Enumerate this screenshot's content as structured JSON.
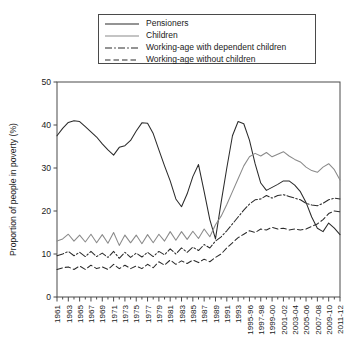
{
  "chart_data": {
    "type": "line",
    "title": "",
    "xlabel": "",
    "ylabel": "Proportion of people in poverty (%)",
    "ylim": [
      0,
      50
    ],
    "yticks": [
      0,
      10,
      20,
      30,
      40,
      50
    ],
    "grid": false,
    "legend_position": "top-center",
    "x": [
      "1961",
      "1962",
      "1963",
      "1964",
      "1965",
      "1966",
      "1967",
      "1968",
      "1969",
      "1970",
      "1971",
      "1972",
      "1973",
      "1974",
      "1975",
      "1976",
      "1977",
      "1978",
      "1979",
      "1980",
      "1981",
      "1982",
      "1983",
      "1984",
      "1985",
      "1986",
      "1987",
      "1988",
      "1989",
      "1990",
      "1991",
      "1992",
      "1993",
      "1994-95",
      "1995-96",
      "1996-97",
      "1997-98",
      "1998-99",
      "1999-00",
      "2000-01",
      "2001-02",
      "2002-03",
      "2003-04",
      "2004-05",
      "2005-06",
      "2006-07",
      "2007-08",
      "2008-09",
      "2009-10",
      "2010-11",
      "2011-12"
    ],
    "xtick_labels": [
      "1961",
      "1963",
      "1965",
      "1967",
      "1969",
      "1971",
      "1973",
      "1975",
      "1977",
      "1979",
      "1981",
      "1983",
      "1985",
      "1987",
      "1989",
      "1991",
      "1993",
      "1995-96",
      "1997-98",
      "1999-00",
      "2001-02",
      "2003-04",
      "2005-06",
      "2007-08",
      "2009-10",
      "2011-12"
    ],
    "series": [
      {
        "name": "Pensioners",
        "style": "solid",
        "color": "#2b2b2b",
        "values": [
          37.5,
          39.2,
          40.6,
          41.0,
          40.8,
          39.6,
          38.4,
          37.2,
          35.6,
          34.2,
          33.0,
          34.8,
          35.2,
          36.4,
          38.6,
          40.5,
          40.4,
          38.0,
          34.2,
          30.5,
          27.0,
          22.8,
          21.0,
          24.0,
          28.0,
          30.8,
          24.5,
          18.0,
          13.5,
          22.0,
          30.0,
          37.5,
          40.8,
          40.3,
          36.5,
          31.0,
          26.5,
          24.8,
          25.5,
          26.2,
          27.0,
          27.0,
          26.0,
          24.5,
          22.0,
          18.6,
          16.0,
          15.2,
          17.2,
          16.0,
          14.5
        ]
      },
      {
        "name": "Children",
        "style": "solid",
        "color": "#8a8a8a",
        "values": [
          13.0,
          13.5,
          14.6,
          13.0,
          14.4,
          12.8,
          14.6,
          12.6,
          14.5,
          12.5,
          15.0,
          12.0,
          14.4,
          12.6,
          14.4,
          12.4,
          14.5,
          12.6,
          14.6,
          13.0,
          15.2,
          13.2,
          15.2,
          13.4,
          15.3,
          13.6,
          15.8,
          14.0,
          16.8,
          18.8,
          21.5,
          24.5,
          27.5,
          30.5,
          32.6,
          33.4,
          32.8,
          33.6,
          32.6,
          33.2,
          33.8,
          32.8,
          32.0,
          31.4,
          30.2,
          29.4,
          29.0,
          30.2,
          31.0,
          29.6,
          27.2
        ]
      },
      {
        "name": "Working-age with dependent children",
        "style": "dashdot",
        "color": "#2b2b2b",
        "values": [
          9.6,
          10.0,
          10.6,
          9.6,
          10.4,
          9.4,
          10.6,
          9.4,
          10.2,
          9.2,
          10.6,
          9.0,
          10.4,
          9.2,
          10.2,
          9.3,
          10.4,
          9.4,
          10.6,
          9.8,
          11.2,
          10.0,
          11.4,
          10.4,
          11.6,
          10.8,
          12.2,
          11.4,
          13.0,
          14.0,
          15.4,
          17.0,
          18.6,
          20.2,
          21.6,
          22.6,
          22.8,
          23.6,
          23.0,
          23.6,
          23.8,
          23.4,
          23.0,
          22.6,
          21.8,
          21.4,
          21.2,
          21.8,
          22.6,
          23.0,
          22.8
        ]
      },
      {
        "name": "Working-age without children",
        "style": "dashed",
        "color": "#2b2b2b",
        "values": [
          6.4,
          6.8,
          7.0,
          6.4,
          7.2,
          6.4,
          7.4,
          6.6,
          7.0,
          6.4,
          7.6,
          6.6,
          7.4,
          6.6,
          7.2,
          6.6,
          7.6,
          6.8,
          8.2,
          7.4,
          8.6,
          7.6,
          8.4,
          7.8,
          8.6,
          8.0,
          8.8,
          8.2,
          9.2,
          10.0,
          11.4,
          12.6,
          13.8,
          14.6,
          15.4,
          15.0,
          15.8,
          15.6,
          16.2,
          15.8,
          16.0,
          15.6,
          15.8,
          15.6,
          15.8,
          16.4,
          17.0,
          18.0,
          19.4,
          20.0,
          19.8
        ]
      }
    ]
  },
  "legend": {
    "items": [
      {
        "label": "Pensioners",
        "style": "solid",
        "color": "#2b2b2b"
      },
      {
        "label": "Children",
        "style": "solid",
        "color": "#8a8a8a"
      },
      {
        "label": "Working-age with dependent children",
        "style": "dashdot",
        "color": "#2b2b2b"
      },
      {
        "label": "Working-age without children",
        "style": "dashed",
        "color": "#2b2b2b"
      }
    ]
  },
  "axes": {
    "y_axis_title": "Proportion of people in poverty (%)"
  }
}
